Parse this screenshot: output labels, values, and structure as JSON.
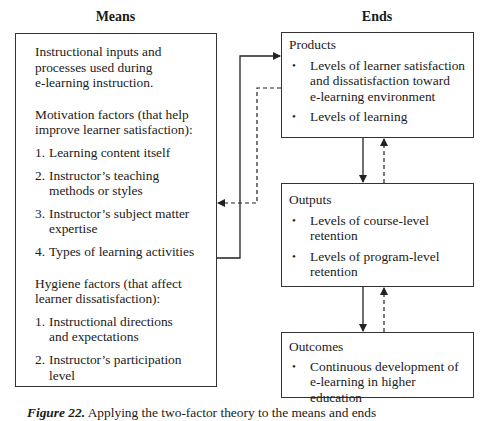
{
  "headings": {
    "means": "Means",
    "ends": "Ends"
  },
  "means_box": {
    "intro": "Instructional inputs and processes used during e-learning instruction.",
    "intro_lines": [
      "Instructional inputs and",
      "processes used during",
      "e-learning instruction."
    ],
    "motivation": {
      "title_lines": [
        "Motivation factors (that help",
        "improve learner satisfaction):"
      ],
      "items": [
        {
          "num": "1.",
          "lines": [
            "Learning content itself"
          ]
        },
        {
          "num": "2.",
          "lines": [
            "Instructor’s teaching",
            "methods or styles"
          ]
        },
        {
          "num": "3.",
          "lines": [
            "Instructor’s subject matter",
            "expertise"
          ]
        },
        {
          "num": "4.",
          "lines": [
            "Types of learning activities"
          ]
        }
      ]
    },
    "hygiene": {
      "title_lines": [
        "Hygiene factors (that affect",
        "learner dissatisfaction):"
      ],
      "items": [
        {
          "num": "1.",
          "lines": [
            "Instructional directions",
            "and expectations"
          ]
        },
        {
          "num": "2.",
          "lines": [
            "Instructor’s participation",
            "level"
          ]
        }
      ]
    }
  },
  "ends": {
    "products": {
      "title": "Products",
      "bullets": [
        {
          "lines": [
            "Levels of learner satisfaction",
            "and dissatisfaction toward",
            "e-learning environment"
          ]
        },
        {
          "lines": [
            "Levels of learning"
          ]
        }
      ]
    },
    "outputs": {
      "title": "Outputs",
      "bullets": [
        {
          "lines": [
            "Levels of course-level",
            "retention"
          ]
        },
        {
          "lines": [
            "Levels of program-level",
            "retention"
          ]
        }
      ]
    },
    "outcomes": {
      "title": "Outcomes",
      "bullets": [
        {
          "lines": [
            "Continuous development of",
            "e-learning in higher education"
          ]
        }
      ]
    }
  },
  "connectors": [
    {
      "from": "means",
      "to": "products",
      "style": "solid"
    },
    {
      "from": "products",
      "to": "means",
      "style": "dashed"
    },
    {
      "from": "products",
      "to": "outputs",
      "style": "solid"
    },
    {
      "from": "outputs",
      "to": "products",
      "style": "dashed"
    },
    {
      "from": "outputs",
      "to": "outcomes",
      "style": "solid"
    },
    {
      "from": "outcomes",
      "to": "outputs",
      "style": "dashed"
    }
  ],
  "caption": {
    "label": "Figure 22.",
    "text": "Applying the two-factor theory to the means and ends"
  },
  "bullet_glyph": "•",
  "colors": {
    "line": "#333333",
    "text": "#1a1a1a",
    "background": "#ffffff"
  }
}
